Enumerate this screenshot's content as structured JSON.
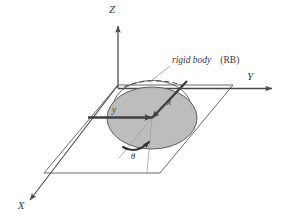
{
  "figure": {
    "type": "technical-diagram",
    "background_color": "#ffffff",
    "line_color": "#3a3a3a",
    "thin_line_color": "#8c8c8c",
    "body_fill_color": "#b9b9b9",
    "body_stroke_color": "#555555",
    "arrow_color": "#404040"
  },
  "axes": {
    "global": [
      {
        "name": "Z",
        "label": "Z",
        "orientation": "vertical-up",
        "label_x": 112,
        "label_y": 13
      },
      {
        "name": "Y",
        "label": "Y",
        "orientation": "horizontal-right",
        "label_x": 250,
        "label_y": 80
      },
      {
        "name": "X",
        "label": "X",
        "orientation": "diagonal-down-left",
        "label_x": 21,
        "label_y": 209
      }
    ]
  },
  "body_frame": {
    "vectors": [
      {
        "name": "y",
        "label": "y",
        "direction": "horizontal-right-into-center",
        "label_x": 114,
        "label_y": 113
      },
      {
        "name": "x",
        "label": "x",
        "direction": "diagonal-upper-right-from-center",
        "label_x": 169,
        "label_y": 105
      }
    ],
    "angle": {
      "name": "theta",
      "label": "θ",
      "label_x": 133,
      "label_y": 159,
      "description": "rotation angle measured in the XY plane"
    }
  },
  "annotations": [
    {
      "name": "rigid-body-callout",
      "text_italic": "rigid body",
      "text_upright": "(RB)",
      "text_x": 172,
      "text_y": 63,
      "leader_from": [
        170,
        66
      ],
      "leader_to": [
        151,
        81
      ]
    }
  ],
  "shapes": {
    "ground_plane": {
      "name": "xy-plane-parallelogram",
      "points": "118,85 233,85 160,173 44,173"
    },
    "rigid_body": {
      "name": "rigid-body-ellipse",
      "center": [
        152,
        118
      ],
      "rx": 45,
      "ry": 31,
      "dome_height": 30,
      "dashed_chord": true
    }
  }
}
